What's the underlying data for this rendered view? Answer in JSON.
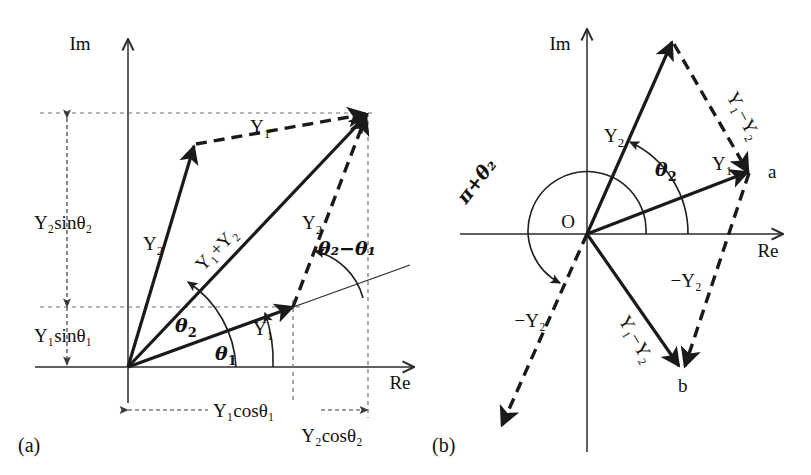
{
  "figure": {
    "type": "diagram",
    "background_color": "#ffffff",
    "ink_color": "#111111"
  },
  "panels": [
    {
      "tag": "(a)",
      "name": "phasor-addition",
      "axes": {
        "imaginary": "Im",
        "real": "Re",
        "origin": ""
      },
      "labels": {
        "y1_dashed": "Y",
        "y1_dashed_sub": "1",
        "y2_solid_left": "Y",
        "y2_solid_left_sub": "2",
        "y1_plus_y2": "Y₁+Y₂",
        "y2_right": "Y",
        "y2_right_sub": "2",
        "y1_lower": "Y",
        "y1_lower_sub": "1",
        "theta1": "θ",
        "theta1_sub": "1",
        "theta2": "θ",
        "theta2_sub": "2",
        "theta_diff": "θ₂−θ₁",
        "y2_sin_theta2": "Y₂sinθ₂",
        "y1_sin_theta1": "Y₁sinθ₁",
        "y1_cos_theta1": "Y₁cosθ₁",
        "y2_cos_theta2": "Y₂cosθ₂"
      }
    },
    {
      "tag": "(b)",
      "name": "phasor-subtraction",
      "axes": {
        "imaginary": "Im",
        "real": "Re",
        "origin": "O"
      },
      "labels": {
        "y2_solid": "Y",
        "y2_solid_sub": "2",
        "y1_solid": "Y",
        "y1_solid_sub": "1",
        "y1_minus_y2_dashed": "Y₁−Y₂",
        "y1_minus_y2_solid": "Y₁−Y₂",
        "minus_y2_right": "−Y₂",
        "minus_y2_left": "−Y₂",
        "theta2": "θ",
        "theta2_sub": "2",
        "pi_plus_theta2": "π+θ₂",
        "point_a": "a",
        "point_b": "b"
      }
    }
  ],
  "symbols": {
    "Y": "Y",
    "theta": "θ",
    "pi": "π",
    "plus": "+",
    "minus": "−",
    "one": "1",
    "two": "2"
  }
}
